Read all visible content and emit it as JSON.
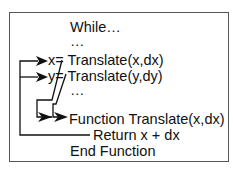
{
  "diagram": {
    "lines": [
      {
        "id": "while",
        "text": "While…"
      },
      {
        "id": "dots1",
        "text": "…"
      },
      {
        "id": "x-assign",
        "text": "x= Translate(x,dx)"
      },
      {
        "id": "y-assign",
        "text": "y= Translate(y,dy)"
      },
      {
        "id": "dots2",
        "text": "…"
      },
      {
        "id": "func-def",
        "text": "Function Translate(x,dx)"
      },
      {
        "id": "return",
        "text": "Return x + dx"
      },
      {
        "id": "end-func",
        "text": "End Function"
      }
    ],
    "arrows": [
      {
        "from": "x-assign",
        "to": "func-def",
        "label": "call"
      },
      {
        "from": "y-assign",
        "to": "func-def",
        "label": "call"
      },
      {
        "from": "return",
        "to": "x-assign",
        "label": "return"
      },
      {
        "from": "return",
        "to": "y-assign",
        "label": "return"
      }
    ]
  }
}
